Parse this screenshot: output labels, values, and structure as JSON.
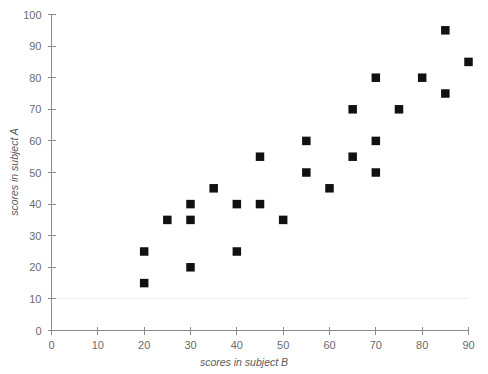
{
  "chart_data": {
    "type": "scatter",
    "title": "",
    "xlabel": "scores in subject B",
    "ylabel": "scores in subject A",
    "xlim": [
      0,
      90
    ],
    "ylim": [
      0,
      100
    ],
    "xticks": [
      0,
      10,
      20,
      30,
      40,
      50,
      60,
      70,
      80,
      90
    ],
    "yticks": [
      0,
      10,
      20,
      30,
      40,
      50,
      60,
      70,
      80,
      90,
      100
    ],
    "grid": "faint horizontal gridline at y=10 only",
    "legend": null,
    "marker_style": "filled-square",
    "marker_color": "#111111",
    "points": [
      {
        "x": 20,
        "y": 15
      },
      {
        "x": 20,
        "y": 25
      },
      {
        "x": 25,
        "y": 35
      },
      {
        "x": 30,
        "y": 20
      },
      {
        "x": 30,
        "y": 35
      },
      {
        "x": 30,
        "y": 40
      },
      {
        "x": 35,
        "y": 45
      },
      {
        "x": 40,
        "y": 25
      },
      {
        "x": 40,
        "y": 40
      },
      {
        "x": 45,
        "y": 40
      },
      {
        "x": 45,
        "y": 55
      },
      {
        "x": 50,
        "y": 35
      },
      {
        "x": 55,
        "y": 50
      },
      {
        "x": 55,
        "y": 60
      },
      {
        "x": 60,
        "y": 45
      },
      {
        "x": 65,
        "y": 55
      },
      {
        "x": 65,
        "y": 70
      },
      {
        "x": 70,
        "y": 50
      },
      {
        "x": 70,
        "y": 60
      },
      {
        "x": 70,
        "y": 80
      },
      {
        "x": 75,
        "y": 70
      },
      {
        "x": 80,
        "y": 80
      },
      {
        "x": 85,
        "y": 75
      },
      {
        "x": 85,
        "y": 95
      },
      {
        "x": 90,
        "y": 85
      }
    ]
  }
}
